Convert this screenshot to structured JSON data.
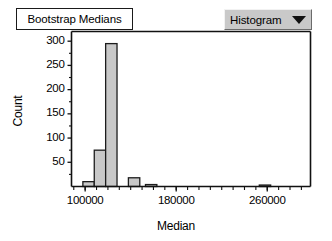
{
  "window": {
    "title": "Bootstrap Medians"
  },
  "controls": {
    "plot_type_dropdown": {
      "selected": "Histogram",
      "arrow_icon": "chevron-down-icon",
      "options": [
        "Histogram"
      ]
    }
  },
  "colors": {
    "bar_fill": "#c8c8c8",
    "bar_stroke": "#1c1c1c",
    "axis": "#111111",
    "dropdown_face": "#c9c9c9",
    "panel_bg": "#ffffff"
  },
  "chart_data": {
    "type": "bar",
    "title": "Bootstrap Medians",
    "xlabel": "Median",
    "ylabel": "Count",
    "xlim": [
      88000,
      298000
    ],
    "ylim": [
      0,
      320
    ],
    "grid": false,
    "legend": null,
    "ytick_labels": [
      "50",
      "100",
      "150",
      "200",
      "250",
      "300"
    ],
    "ytick_values": [
      50,
      100,
      150,
      200,
      250,
      300
    ],
    "xtick_labels": [
      "100000",
      "180000",
      "260000"
    ],
    "xtick_values": [
      100000,
      180000,
      260000
    ],
    "x_minor_step": 10000,
    "bin_width": 10000,
    "bins": [
      {
        "left": 98000,
        "right": 108000,
        "count": 10
      },
      {
        "left": 108000,
        "right": 118000,
        "count": 75
      },
      {
        "left": 118000,
        "right": 128000,
        "count": 295
      },
      {
        "left": 138000,
        "right": 148000,
        "count": 18
      },
      {
        "left": 153000,
        "right": 163000,
        "count": 4
      },
      {
        "left": 253000,
        "right": 263000,
        "count": 3
      }
    ],
    "categories": [
      "98000",
      "108000",
      "118000",
      "138000",
      "153000",
      "253000"
    ],
    "values": [
      10,
      75,
      295,
      18,
      4,
      3
    ]
  }
}
